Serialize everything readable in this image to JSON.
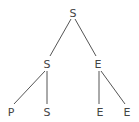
{
  "diagram": {
    "type": "tree",
    "nodes": [
      {
        "id": "root",
        "label": "S",
        "x": 73,
        "y": 17
      },
      {
        "id": "n1",
        "label": "S",
        "x": 47,
        "y": 68
      },
      {
        "id": "n2",
        "label": "E",
        "x": 98,
        "y": 68
      },
      {
        "id": "n3",
        "label": "P",
        "x": 11,
        "y": 116
      },
      {
        "id": "n4",
        "label": "S",
        "x": 47,
        "y": 116
      },
      {
        "id": "n5",
        "label": "E",
        "x": 100,
        "y": 116
      },
      {
        "id": "n6",
        "label": "E",
        "x": 127,
        "y": 116
      }
    ],
    "edges": [
      {
        "from": "root",
        "to": "n1"
      },
      {
        "from": "root",
        "to": "n2"
      },
      {
        "from": "n1",
        "to": "n3"
      },
      {
        "from": "n1",
        "to": "n4"
      },
      {
        "from": "n2",
        "to": "n5"
      },
      {
        "from": "n2",
        "to": "n6"
      }
    ],
    "colors": {
      "line": "#555555",
      "text": "#444444",
      "background": "#ffffff"
    }
  }
}
